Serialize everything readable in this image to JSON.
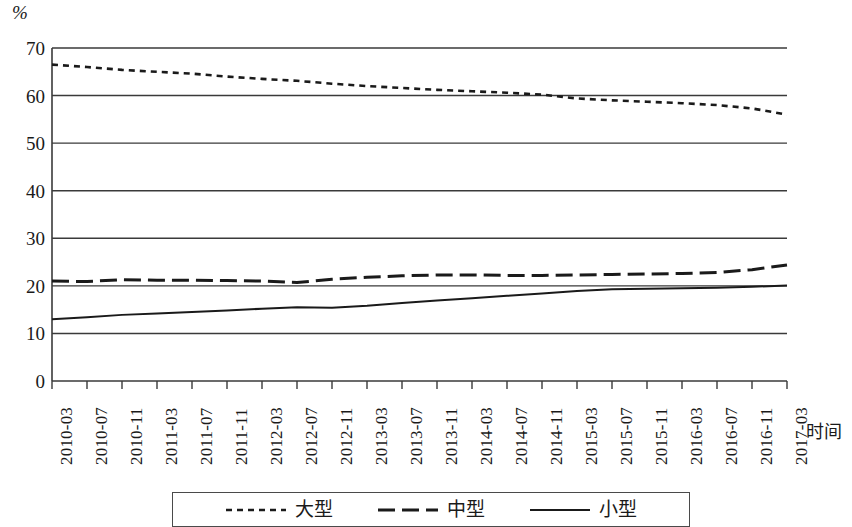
{
  "chart_data": {
    "type": "line",
    "title": "",
    "subtitle": "",
    "xlabel": "时间",
    "ylabel": "%",
    "y_unit_caption": "%",
    "ylim": [
      0,
      70
    ],
    "y_ticks": [
      0,
      10,
      20,
      30,
      40,
      50,
      60,
      70
    ],
    "grid": true,
    "grid_axis": "y",
    "legend_position": "bottom",
    "categories": [
      "2010-03",
      "2010-07",
      "2010-11",
      "2011-03",
      "2011-07",
      "2011-11",
      "2012-03",
      "2012-07",
      "2012-11",
      "2013-03",
      "2013-07",
      "2013-11",
      "2014-03",
      "2014-07",
      "2014-11",
      "2015-03",
      "2015-07",
      "2015-11",
      "2016-03",
      "2016-07",
      "2016-11",
      "2017-03"
    ],
    "series": [
      {
        "name": "大型",
        "style": "dotted",
        "color": "#1a1a1a",
        "values": [
          66.5,
          66.0,
          65.4,
          65.0,
          64.6,
          64.0,
          63.5,
          63.1,
          62.5,
          62.0,
          61.6,
          61.2,
          60.9,
          60.6,
          60.2,
          59.4,
          59.0,
          58.7,
          58.4,
          58.0,
          57.3,
          56.0
        ]
      },
      {
        "name": "中型",
        "style": "dashed",
        "color": "#1a1a1a",
        "values": [
          21.0,
          20.9,
          21.3,
          21.2,
          21.2,
          21.1,
          21.0,
          20.7,
          21.4,
          21.8,
          22.1,
          22.3,
          22.3,
          22.2,
          22.2,
          22.3,
          22.4,
          22.5,
          22.6,
          22.8,
          23.4,
          24.4
        ]
      },
      {
        "name": "小型",
        "style": "solid",
        "color": "#1a1a1a",
        "values": [
          13.0,
          13.4,
          13.9,
          14.2,
          14.5,
          14.8,
          15.2,
          15.5,
          15.4,
          15.8,
          16.4,
          16.9,
          17.4,
          17.9,
          18.4,
          18.9,
          19.3,
          19.4,
          19.5,
          19.6,
          19.8,
          20.1
        ]
      }
    ],
    "axis_color": "#3a3a3a",
    "gridline_color": "#3a3a3a",
    "plot_area": {
      "left": 52,
      "right": 787,
      "top": 48,
      "bottom": 381
    }
  },
  "legend": {
    "items": [
      {
        "label": "大型",
        "style": "dotted"
      },
      {
        "label": "中型",
        "style": "dashed"
      },
      {
        "label": "小型",
        "style": "solid"
      }
    ]
  }
}
